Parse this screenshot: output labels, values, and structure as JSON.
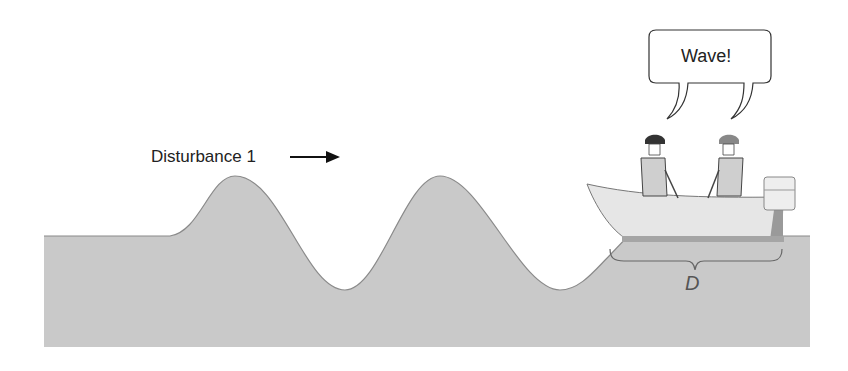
{
  "diagram": {
    "disturbance_label": "Disturbance 1",
    "speech_bubble_text": "Wave!",
    "distance_label": "D",
    "colors": {
      "water": "#c9c9c9",
      "water_outline": "#8a8a8a",
      "boat": "#e4e4e4",
      "ink": "#222222"
    }
  }
}
